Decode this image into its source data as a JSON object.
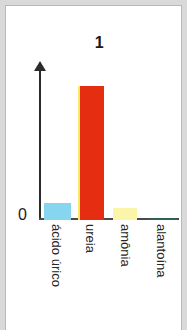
{
  "figure": {
    "title": "1",
    "zero_label": "0",
    "background_color": "#ffffff",
    "page_background_color": "#d9d9d9",
    "border_color": "#b8b8b8",
    "axis_color": "#2b2b2b"
  },
  "chart_data": {
    "type": "bar",
    "title": "1",
    "xlabel": "",
    "ylabel": "",
    "grid": false,
    "legend": null,
    "orientation": "vertical",
    "axis_style": "arrow-y-axis",
    "ytick_labels": [
      "0"
    ],
    "categories": [
      "ácido úrico",
      "ureia",
      "amônia",
      "alantoína"
    ],
    "values": [
      13,
      100,
      9,
      1.5
    ],
    "ylim": [
      0,
      107
    ],
    "value_units": "relative (unlabeled axis)",
    "colors": [
      "#87d6f0",
      "#e52d12",
      "#faf5a8",
      "#2f5f55"
    ],
    "series": [
      {
        "name": "excreção nitrogenada",
        "values": [
          13,
          100,
          9,
          1.5
        ]
      }
    ],
    "bars": [
      {
        "category": "ácido úrico",
        "value": 13,
        "color": "#87d6f0",
        "edge_color": "#87d6f0"
      },
      {
        "category": "ureia",
        "value": 100,
        "color": "#e52d12",
        "edge_color": "#fbe96a"
      },
      {
        "category": "amônia",
        "value": 9,
        "color": "#faf5a8",
        "edge_color": "#faf5a8"
      },
      {
        "category": "alantoína",
        "value": 1.5,
        "color": "#2f5f55",
        "edge_color": "#2f5f55"
      }
    ]
  }
}
